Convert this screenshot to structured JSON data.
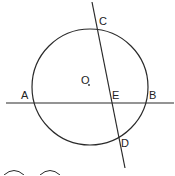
{
  "diagram": {
    "type": "geometry",
    "colors": {
      "stroke": "#2a2a2a",
      "background": "#ffffff"
    },
    "labels": {
      "C": "C",
      "O": "O",
      "A": "A",
      "E": "E",
      "B": "B",
      "D": "D"
    },
    "points": {
      "O": [
        90,
        86
      ],
      "A": [
        32,
        103
      ],
      "B": [
        147,
        103
      ],
      "C": [
        97,
        28
      ],
      "D": [
        119,
        137
      ],
      "E": [
        112,
        103
      ]
    },
    "circle": {
      "center": [
        90,
        87
      ],
      "r": 58
    }
  }
}
